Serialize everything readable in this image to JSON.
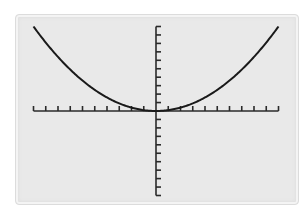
{
  "chart_data": {
    "type": "line",
    "title": "",
    "xlabel": "",
    "ylabel": "",
    "xlim": [
      -10,
      10
    ],
    "ylim": [
      -10,
      10
    ],
    "x_tick_step": 1,
    "y_tick_step": 1,
    "grid": false,
    "legend": null,
    "series": [
      {
        "name": "y = 0.1x^2",
        "x": [
          -10,
          -9,
          -8,
          -7,
          -6,
          -5,
          -4,
          -3,
          -2,
          -1,
          0,
          1,
          2,
          3,
          4,
          5,
          6,
          7,
          8,
          9,
          10
        ],
        "y": [
          10,
          8.1,
          6.4,
          4.9,
          3.6,
          2.5,
          1.6,
          0.9,
          0.4,
          0.1,
          0,
          0.1,
          0.4,
          0.9,
          1.6,
          2.5,
          3.6,
          4.9,
          6.4,
          8.1,
          10
        ]
      }
    ]
  },
  "colors": {
    "screen_bg": "#e9e9e9",
    "axis": "#2a2a2a",
    "curve": "#1a1a1a"
  }
}
